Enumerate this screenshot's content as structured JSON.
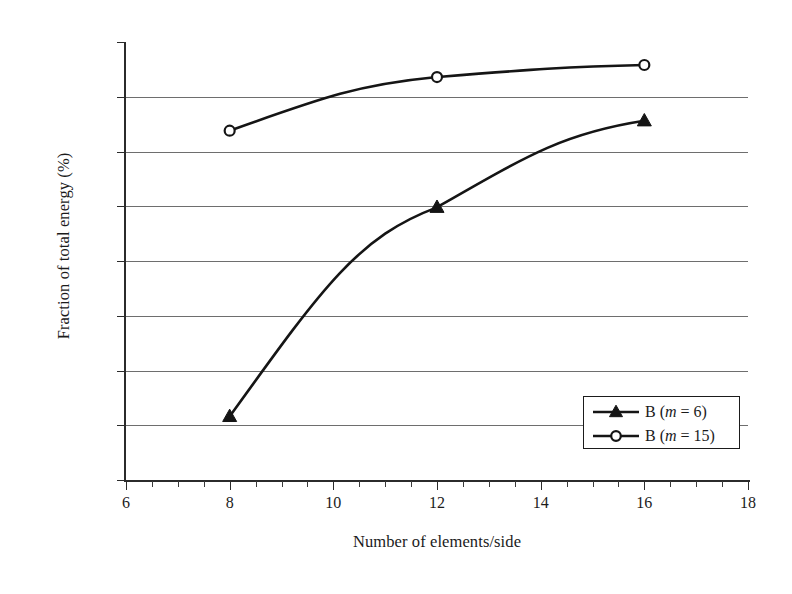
{
  "chart_data": {
    "type": "line",
    "title": "",
    "xlabel": "Number of elements/side",
    "ylabel": "Fraction of total energy (%)",
    "xlim": [
      6,
      18
    ],
    "ylim": [
      60.0,
      100.0
    ],
    "xticks": [
      6,
      8,
      10,
      12,
      14,
      16,
      18
    ],
    "xtick_labels": [
      "6",
      "8",
      "10",
      "12",
      "14",
      "16",
      "18"
    ],
    "x_minor_step": 0.5,
    "yticks": [
      60.0,
      65.0,
      70.0,
      75.0,
      80.0,
      85.0,
      90.0,
      95.0,
      100.0
    ],
    "ytick_labels": [
      "60.0",
      "65.0",
      "70.0",
      "75.0",
      "80.0",
      "85.0",
      "90.0",
      "95.0",
      "100.0"
    ],
    "grid": "horizontal",
    "legend_position": "lower right",
    "x": [
      8,
      12,
      16
    ],
    "series": [
      {
        "name": "B (m = 6)",
        "label_prefix": "B (",
        "label_italic": "m",
        "label_suffix": " = 6)",
        "marker": "filled-triangle",
        "color": "#151515",
        "values": [
          65.8,
          84.9,
          92.8
        ]
      },
      {
        "name": "B (m = 15)",
        "label_prefix": "B (",
        "label_italic": "m",
        "label_suffix": " = 15)",
        "marker": "open-circle",
        "color": "#151515",
        "values": [
          91.9,
          96.8,
          97.9
        ]
      }
    ]
  },
  "axes": {
    "y_title": "Fraction of total energy (%)",
    "x_title": "Number of elements/side"
  },
  "legend": {
    "items": [
      {
        "prefix": "B (",
        "italic": "m",
        "suffix": " = 6)",
        "marker": "filled-triangle"
      },
      {
        "prefix": "B (",
        "italic": "m",
        "suffix": " = 15)",
        "marker": "open-circle"
      }
    ]
  },
  "colors": {
    "line": "#151515",
    "grid": "#6e6e6e",
    "axis": "#2b2b2b",
    "background": "#ffffff",
    "text": "#1b1b1b"
  }
}
